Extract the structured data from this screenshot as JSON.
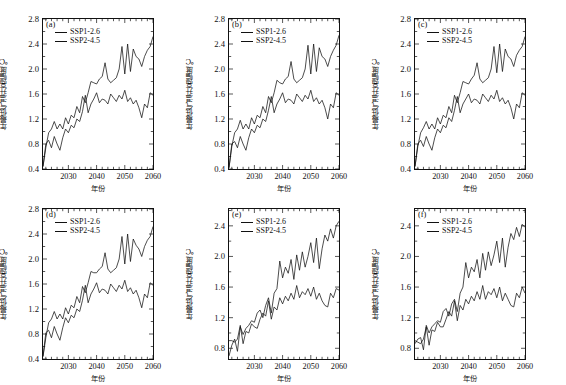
{
  "figure": {
    "width": 566,
    "height": 385,
    "axis_color": "#111111",
    "series_color": "#111111",
    "caption": ""
  },
  "legend": {
    "entries": [
      {
        "label": "SSP1-2.6"
      },
      {
        "label": "SSP2-4.5"
      }
    ]
  },
  "labels": {
    "ylabel": "年最低气温升高幅度/℃",
    "xlabel": "年份"
  },
  "chart_data": [
    {
      "id": "a",
      "type": "line",
      "panel_tag": "(a)",
      "title": "",
      "xlabel": "年份",
      "ylabel": "年最低气温升高幅度/℃",
      "xlim": [
        2021,
        2060
      ],
      "ylim": [
        0.4,
        2.8
      ],
      "xticks": [
        2030,
        2040,
        2050,
        2060
      ],
      "yticks": [
        0.4,
        0.8,
        1.2,
        1.6,
        2.0,
        2.4,
        2.8
      ],
      "grid": false,
      "legend_position": "top-left",
      "x": [
        2021,
        2022,
        2023,
        2024,
        2025,
        2026,
        2027,
        2028,
        2029,
        2030,
        2031,
        2032,
        2033,
        2034,
        2035,
        2036,
        2037,
        2038,
        2039,
        2040,
        2041,
        2042,
        2043,
        2044,
        2045,
        2046,
        2047,
        2048,
        2049,
        2050,
        2051,
        2052,
        2053,
        2054,
        2055,
        2056,
        2057,
        2058,
        2059,
        2060
      ],
      "series": [
        {
          "name": "SSP1-2.6",
          "values": [
            0.44,
            0.8,
            0.86,
            0.74,
            0.92,
            0.8,
            0.7,
            0.9,
            1.04,
            0.98,
            1.1,
            1.06,
            1.2,
            1.16,
            1.32,
            1.58,
            1.3,
            1.44,
            1.52,
            1.62,
            1.46,
            1.52,
            1.5,
            1.44,
            1.6,
            1.54,
            1.48,
            1.58,
            1.52,
            1.66,
            1.48,
            1.54,
            1.44,
            1.5,
            1.38,
            1.22,
            1.44,
            1.38,
            1.62,
            1.58
          ]
        },
        {
          "name": "SSP2-4.5",
          "values": [
            0.44,
            0.74,
            0.98,
            1.04,
            1.16,
            1.04,
            1.12,
            1.04,
            1.22,
            1.12,
            1.26,
            1.22,
            1.4,
            1.3,
            1.56,
            1.46,
            1.62,
            1.8,
            1.78,
            1.76,
            1.84,
            1.88,
            2.1,
            1.84,
            1.78,
            1.82,
            1.86,
            2.0,
            2.36,
            1.92,
            2.4,
            1.96,
            2.32,
            2.2,
            2.16,
            2.04,
            2.2,
            2.3,
            2.36,
            2.52
          ]
        }
      ]
    },
    {
      "id": "b",
      "type": "line",
      "panel_tag": "(b)",
      "title": "",
      "xlabel": "年份",
      "ylabel": "年最低气温升高幅度/℃",
      "xlim": [
        2021,
        2060
      ],
      "ylim": [
        0.4,
        2.8
      ],
      "xticks": [
        2030,
        2040,
        2050,
        2060
      ],
      "yticks": [
        0.4,
        0.8,
        1.2,
        1.6,
        2.0,
        2.4,
        2.8
      ],
      "grid": false,
      "legend_position": "top-left",
      "x": [
        2021,
        2022,
        2023,
        2024,
        2025,
        2026,
        2027,
        2028,
        2029,
        2030,
        2031,
        2032,
        2033,
        2034,
        2035,
        2036,
        2037,
        2038,
        2039,
        2040,
        2041,
        2042,
        2043,
        2044,
        2045,
        2046,
        2047,
        2048,
        2049,
        2050,
        2051,
        2052,
        2053,
        2054,
        2055,
        2056,
        2057,
        2058,
        2059,
        2060
      ],
      "series": [
        {
          "name": "SSP1-2.6",
          "values": [
            0.42,
            0.8,
            0.84,
            0.74,
            0.92,
            0.8,
            0.7,
            0.9,
            1.04,
            0.98,
            1.1,
            1.06,
            1.2,
            1.16,
            1.34,
            1.56,
            1.3,
            1.44,
            1.52,
            1.62,
            1.46,
            1.52,
            1.5,
            1.44,
            1.6,
            1.54,
            1.48,
            1.58,
            1.52,
            1.66,
            1.48,
            1.54,
            1.44,
            1.5,
            1.38,
            1.2,
            1.44,
            1.38,
            1.62,
            1.58
          ]
        },
        {
          "name": "SSP2-4.5",
          "values": [
            0.42,
            0.76,
            0.98,
            1.04,
            1.18,
            1.04,
            1.12,
            1.04,
            1.22,
            1.12,
            1.26,
            1.22,
            1.4,
            1.3,
            1.56,
            1.46,
            1.62,
            1.82,
            1.78,
            1.76,
            1.84,
            1.88,
            2.12,
            1.84,
            1.78,
            1.82,
            1.86,
            2.0,
            2.38,
            1.92,
            2.4,
            1.96,
            2.34,
            2.2,
            2.16,
            2.04,
            2.2,
            2.3,
            2.38,
            2.54
          ]
        }
      ]
    },
    {
      "id": "c",
      "type": "line",
      "panel_tag": "(c)",
      "title": "",
      "xlabel": "年份",
      "ylabel": "年最低气温升高幅度/℃",
      "xlim": [
        2021,
        2060
      ],
      "ylim": [
        0.4,
        2.8
      ],
      "xticks": [
        2030,
        2040,
        2050,
        2060
      ],
      "yticks": [
        0.4,
        0.8,
        1.2,
        1.6,
        2.0,
        2.4,
        2.8
      ],
      "grid": false,
      "legend_position": "top-left",
      "x": [
        2021,
        2022,
        2023,
        2024,
        2025,
        2026,
        2027,
        2028,
        2029,
        2030,
        2031,
        2032,
        2033,
        2034,
        2035,
        2036,
        2037,
        2038,
        2039,
        2040,
        2041,
        2042,
        2043,
        2044,
        2045,
        2046,
        2047,
        2048,
        2049,
        2050,
        2051,
        2052,
        2053,
        2054,
        2055,
        2056,
        2057,
        2058,
        2059,
        2060
      ],
      "series": [
        {
          "name": "SSP1-2.6",
          "values": [
            0.44,
            0.8,
            0.86,
            0.76,
            0.92,
            0.8,
            0.7,
            0.9,
            1.04,
            0.98,
            1.1,
            1.06,
            1.22,
            1.16,
            1.34,
            1.56,
            1.3,
            1.44,
            1.52,
            1.6,
            1.46,
            1.52,
            1.5,
            1.44,
            1.6,
            1.54,
            1.48,
            1.58,
            1.52,
            1.66,
            1.48,
            1.54,
            1.44,
            1.5,
            1.38,
            1.2,
            1.44,
            1.38,
            1.62,
            1.58
          ]
        },
        {
          "name": "SSP2-4.5",
          "values": [
            0.44,
            0.76,
            0.98,
            1.06,
            1.16,
            1.04,
            1.12,
            1.04,
            1.22,
            1.12,
            1.26,
            1.22,
            1.4,
            1.3,
            1.58,
            1.46,
            1.62,
            1.8,
            1.78,
            1.76,
            1.84,
            1.9,
            2.1,
            1.84,
            1.78,
            1.82,
            1.86,
            2.0,
            2.36,
            1.94,
            2.4,
            1.96,
            2.32,
            2.2,
            2.16,
            2.04,
            2.22,
            2.3,
            2.36,
            2.52
          ]
        }
      ]
    },
    {
      "id": "d",
      "type": "line",
      "panel_tag": "(d)",
      "title": "",
      "xlabel": "年份",
      "ylabel": "年最低气温升高幅度/℃",
      "xlim": [
        2021,
        2060
      ],
      "ylim": [
        0.4,
        2.8
      ],
      "xticks": [
        2030,
        2040,
        2050,
        2060
      ],
      "yticks": [
        0.4,
        0.8,
        1.2,
        1.6,
        2.0,
        2.4,
        2.8
      ],
      "grid": false,
      "legend_position": "top-left",
      "x": [
        2021,
        2022,
        2023,
        2024,
        2025,
        2026,
        2027,
        2028,
        2029,
        2030,
        2031,
        2032,
        2033,
        2034,
        2035,
        2036,
        2037,
        2038,
        2039,
        2040,
        2041,
        2042,
        2043,
        2044,
        2045,
        2046,
        2047,
        2048,
        2049,
        2050,
        2051,
        2052,
        2053,
        2054,
        2055,
        2056,
        2057,
        2058,
        2059,
        2060
      ],
      "series": [
        {
          "name": "SSP1-2.6",
          "values": [
            0.44,
            0.82,
            0.86,
            0.74,
            0.92,
            0.8,
            0.7,
            0.9,
            1.06,
            0.98,
            1.1,
            1.06,
            1.2,
            1.16,
            1.34,
            1.58,
            1.3,
            1.44,
            1.52,
            1.62,
            1.46,
            1.52,
            1.5,
            1.44,
            1.6,
            1.54,
            1.48,
            1.58,
            1.52,
            1.66,
            1.48,
            1.54,
            1.44,
            1.5,
            1.38,
            1.22,
            1.44,
            1.38,
            1.62,
            1.58
          ]
        },
        {
          "name": "SSP2-4.5",
          "values": [
            0.44,
            0.74,
            0.98,
            1.04,
            1.16,
            1.04,
            1.12,
            1.04,
            1.22,
            1.12,
            1.26,
            1.22,
            1.4,
            1.3,
            1.56,
            1.46,
            1.62,
            1.8,
            1.78,
            1.78,
            1.84,
            1.88,
            2.1,
            1.84,
            1.78,
            1.82,
            1.86,
            2.0,
            2.36,
            1.92,
            2.4,
            1.96,
            2.32,
            2.22,
            2.16,
            2.04,
            2.2,
            2.3,
            2.36,
            2.52
          ]
        }
      ]
    },
    {
      "id": "e",
      "type": "line",
      "panel_tag": "(e)",
      "title": "",
      "xlabel": "年份",
      "ylabel": "年最低气温升高幅度/℃",
      "xlim": [
        2021,
        2060
      ],
      "ylim": [
        0.66,
        2.62
      ],
      "xticks": [
        2030,
        2040,
        2050,
        2060
      ],
      "yticks": [
        0.8,
        1.2,
        1.6,
        2.0,
        2.4
      ],
      "grid": false,
      "legend_position": "top-left",
      "x": [
        2021,
        2022,
        2023,
        2024,
        2025,
        2026,
        2027,
        2028,
        2029,
        2030,
        2031,
        2032,
        2033,
        2034,
        2035,
        2036,
        2037,
        2038,
        2039,
        2040,
        2041,
        2042,
        2043,
        2044,
        2045,
        2046,
        2047,
        2048,
        2049,
        2050,
        2051,
        2052,
        2053,
        2054,
        2055,
        2056,
        2057,
        2058,
        2059,
        2060
      ],
      "series": [
        {
          "name": "SSP1-2.6",
          "values": [
            0.9,
            0.9,
            0.88,
            0.92,
            1.1,
            0.86,
            1.02,
            1.0,
            1.12,
            1.08,
            1.06,
            1.18,
            1.26,
            1.22,
            1.42,
            1.18,
            1.34,
            1.3,
            1.46,
            1.38,
            1.48,
            1.42,
            1.52,
            1.44,
            1.62,
            1.46,
            1.54,
            1.5,
            1.58,
            1.48,
            1.6,
            1.44,
            1.52,
            1.42,
            1.36,
            1.34,
            1.52,
            1.46,
            1.58,
            1.56
          ]
        },
        {
          "name": "SSP2-4.5",
          "values": [
            0.7,
            0.84,
            0.92,
            0.76,
            1.08,
            0.98,
            1.06,
            1.1,
            1.16,
            1.14,
            1.26,
            1.3,
            1.2,
            1.36,
            1.46,
            1.26,
            1.52,
            1.58,
            1.94,
            1.72,
            1.86,
            1.78,
            1.96,
            1.7,
            2.02,
            1.82,
            2.06,
            1.86,
            2.0,
            2.18,
            1.92,
            2.24,
            1.84,
            2.1,
            2.28,
            2.2,
            2.36,
            2.24,
            2.4,
            2.46
          ]
        }
      ]
    },
    {
      "id": "f",
      "type": "line",
      "panel_tag": "(f)",
      "title": "",
      "xlabel": "年份",
      "ylabel": "年最低气温升高幅度/℃",
      "xlim": [
        2021,
        2060
      ],
      "ylim": [
        0.66,
        2.62
      ],
      "xticks": [
        2030,
        2040,
        2050,
        2060
      ],
      "yticks": [
        0.8,
        1.2,
        1.6,
        2.0,
        2.4
      ],
      "grid": false,
      "legend_position": "top-left",
      "x": [
        2021,
        2022,
        2023,
        2024,
        2025,
        2026,
        2027,
        2028,
        2029,
        2030,
        2031,
        2032,
        2033,
        2034,
        2035,
        2036,
        2037,
        2038,
        2039,
        2040,
        2041,
        2042,
        2043,
        2044,
        2045,
        2046,
        2047,
        2048,
        2049,
        2050,
        2051,
        2052,
        2053,
        2054,
        2055,
        2056,
        2057,
        2058,
        2059,
        2060
      ],
      "series": [
        {
          "name": "SSP1-2.6",
          "values": [
            0.9,
            0.88,
            0.86,
            0.92,
            1.08,
            0.84,
            1.04,
            1.02,
            1.14,
            1.08,
            1.08,
            1.18,
            1.28,
            1.22,
            1.42,
            1.16,
            1.36,
            1.3,
            1.44,
            1.38,
            1.48,
            1.42,
            1.54,
            1.44,
            1.62,
            1.44,
            1.54,
            1.5,
            1.58,
            1.46,
            1.6,
            1.42,
            1.52,
            1.44,
            1.36,
            1.34,
            1.52,
            1.46,
            1.6,
            1.52
          ]
        },
        {
          "name": "SSP2-4.5",
          "values": [
            0.86,
            0.92,
            0.94,
            0.78,
            1.1,
            1.0,
            1.08,
            1.12,
            1.16,
            1.14,
            1.28,
            1.32,
            1.22,
            1.38,
            1.44,
            1.28,
            1.52,
            1.6,
            1.92,
            1.72,
            1.86,
            1.8,
            1.96,
            1.72,
            2.04,
            1.82,
            2.06,
            1.88,
            2.02,
            2.2,
            1.92,
            2.24,
            1.86,
            2.12,
            2.3,
            2.22,
            2.38,
            2.26,
            2.42,
            2.38
          ]
        }
      ]
    }
  ]
}
